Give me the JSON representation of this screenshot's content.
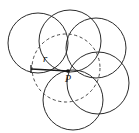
{
  "figure": {
    "canvas": {
      "width": 139,
      "height": 133,
      "background": "#ffffff"
    },
    "labels": {
      "radius": "r",
      "center_point": "P"
    },
    "colors": {
      "solid_stroke": "#2b2b2b",
      "dashed_stroke": "#4a4a4a",
      "radius_line": "#1a1a1a",
      "label": "#141414"
    },
    "common_point": {
      "name": "P",
      "x": 68,
      "y": 71
    },
    "locus_circle": {
      "name": "dashed-locus-circle",
      "style": "dashed",
      "cx": 66,
      "cy": 68,
      "r": 34
    },
    "radius_segment": {
      "label": "r",
      "x1": 31,
      "y1": 69,
      "x2": 68,
      "y2": 71,
      "label_x": 43,
      "label_y": 62
    },
    "point_label": {
      "text": "P",
      "x": 65,
      "y": 82
    },
    "circles": [
      {
        "name": "circle-upper-left",
        "cx": 38,
        "cy": 43,
        "r": 30
      },
      {
        "name": "circle-top",
        "cx": 70,
        "cy": 41,
        "r": 31
      },
      {
        "name": "circle-upper-right",
        "cx": 96,
        "cy": 48,
        "r": 30
      },
      {
        "name": "circle-lower-right",
        "cx": 98,
        "cy": 83,
        "r": 31
      },
      {
        "name": "circle-bottom",
        "cx": 73,
        "cy": 100,
        "r": 30
      }
    ]
  }
}
